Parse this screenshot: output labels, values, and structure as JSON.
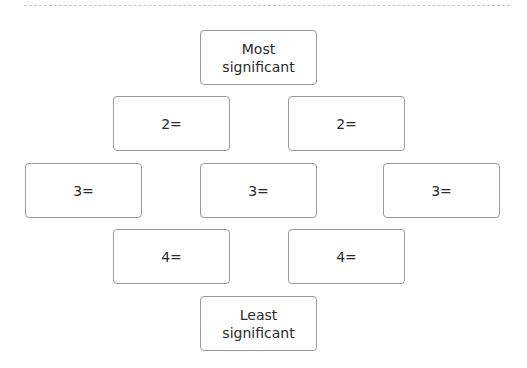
{
  "diagram": {
    "title": "",
    "boxes": [
      {
        "id": "most",
        "label": "Most\nsignificant",
        "row": 1
      },
      {
        "id": "r2-left",
        "label": "2=",
        "row": 2
      },
      {
        "id": "r2-right",
        "label": "2=",
        "row": 2
      },
      {
        "id": "r3-left",
        "label": "3=",
        "row": 3
      },
      {
        "id": "r3-center",
        "label": "3=",
        "row": 3
      },
      {
        "id": "r3-right",
        "label": "3=",
        "row": 3
      },
      {
        "id": "r4-left",
        "label": "4=",
        "row": 4
      },
      {
        "id": "r4-right",
        "label": "4=",
        "row": 4
      },
      {
        "id": "least",
        "label": "Least\nsignificant",
        "row": 5
      }
    ]
  },
  "colors": {
    "border": "#9a9a9a",
    "text": "#2a2a2a",
    "dashed_rule": "#c8c8c8",
    "background": "#ffffff"
  }
}
